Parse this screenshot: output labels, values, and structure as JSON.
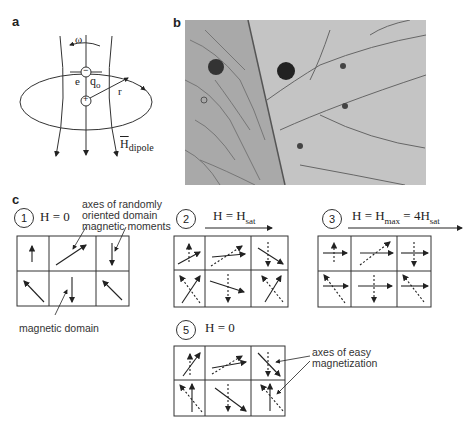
{
  "panels": {
    "a": {
      "label": "a",
      "omega": "ω",
      "electron": "e",
      "charge": "q",
      "charge_sub": "o",
      "radius": "r",
      "field": "H",
      "field_sub": "dipole",
      "electron_sign": "−",
      "nucleus_sign": "+"
    },
    "b": {
      "label": "b",
      "description": "micrograph of magnetic domains"
    },
    "c": {
      "label": "c",
      "steps": [
        {
          "num": "1",
          "label": "H = 0"
        },
        {
          "num": "2",
          "label_main": "H = H",
          "label_sub": "sat"
        },
        {
          "num": "3",
          "label_main": "H = H",
          "label_sub1": "max",
          "label_mid": " = 4H",
          "label_sub2": "sat"
        },
        {
          "num": "5",
          "label": "H = 0"
        }
      ],
      "annotations": {
        "axes_random_line1": "axes of randomly",
        "axes_random_line2": "oriented domain",
        "axes_random_line3": "magnetic moments",
        "magnetic_domain": "magnetic domain",
        "easy_axes_line1": "axes of easy",
        "easy_axes_line2": "magnetization"
      }
    }
  }
}
